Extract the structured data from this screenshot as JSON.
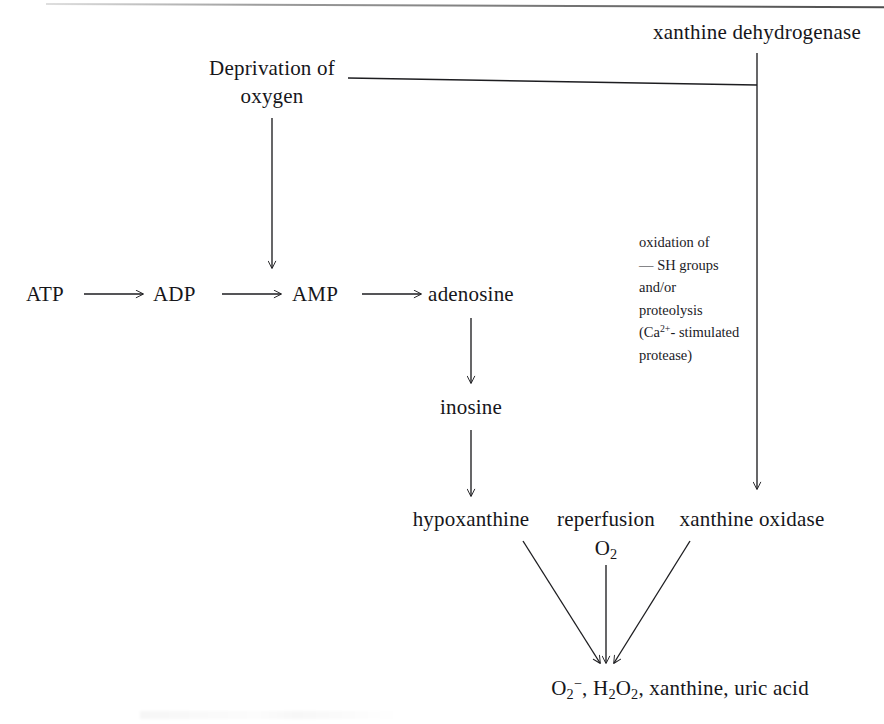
{
  "diagram": {
    "nodes": {
      "atp": "ATP",
      "adp": "ADP",
      "amp": "AMP",
      "adenosine": "adenosine",
      "inosine": "inosine",
      "hypoxanthine": "hypoxanthine",
      "deprivation_line1": "Deprivation of",
      "deprivation_line2": "oxygen",
      "xanthine_dehydrogenase": "xanthine dehydrogenase",
      "xanthine_oxidase": "xanthine oxidase",
      "reperfusion": "reperfusion",
      "reperfusion_o2_formula": "O2",
      "reperfusion_o2_sub": "2",
      "reperfusion_o2_base": "O"
    },
    "annotation": {
      "line1": "oxidation of",
      "line2_dash": "—",
      "line2_text": "SH groups",
      "line3": "and/or",
      "line4": "proteolysis",
      "line5_prefix": "(Ca",
      "line5_sup": "2+",
      "line5_suffix": "- stimulated",
      "line6": "protease)"
    },
    "products": {
      "superoxide_base": "O",
      "superoxide_sub": "2",
      "superoxide_sup": "−",
      "separator1": ", ",
      "peroxide_h": "H",
      "peroxide_sub1": "2",
      "peroxide_o": "O",
      "peroxide_sub2": "2",
      "separator2": ", ",
      "xanthine": "xanthine",
      "separator3": ", ",
      "uric_acid": "uric acid",
      "full_text": "O2−, H2O2, xanthine, uric acid"
    },
    "colors": {
      "ink": "#16161a",
      "stroke": "#1d1d20",
      "background": "#ffffff",
      "rule": "#4a4a4a"
    }
  }
}
